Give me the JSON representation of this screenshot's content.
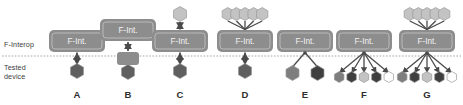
{
  "diagram": {
    "axis_labels": {
      "upper": "F-Interop",
      "lower": "Tested\ndevice"
    },
    "colors": {
      "fint_box_fill": "#8d8d8d",
      "fint_box_inner_border": "#b9b9b9",
      "fint_box_text": "#f2f2f2",
      "hex_dark": "#5f5f5f",
      "hex_darker": "#3f3f3f",
      "hex_medium": "#7e7e7e",
      "hex_light": "#c3c3c3",
      "hex_white": "#ffffff",
      "hex_outline": "#9a9a9a",
      "connector": "#4a4a4a",
      "divider": "#9a9a9a",
      "label_text": "#3b3b3b",
      "letter_text": "#2e2e2e"
    },
    "fint_label": "F-Int.",
    "columns": [
      {
        "id": "A",
        "letter": "A",
        "cx": 77,
        "fint_box": {
          "w": 56,
          "h": 22,
          "cy": 41
        },
        "top_nodes": [],
        "bottom_nodes": [
          {
            "shade": "hex_dark",
            "size": 15
          }
        ],
        "connector_type": "double-arrow",
        "intermediate_box": false
      },
      {
        "id": "B",
        "letter": "B",
        "cx": 128,
        "fint_box": {
          "w": 56,
          "h": 22,
          "cy": 30
        },
        "top_nodes": [],
        "bottom_nodes": [
          {
            "shade": "hex_dark",
            "size": 15
          }
        ],
        "connector_type": "double-arrow",
        "intermediate_box": true
      },
      {
        "id": "C",
        "letter": "C",
        "cx": 180,
        "fint_box": {
          "w": 56,
          "h": 22,
          "cy": 41
        },
        "top_nodes": [
          {
            "shade": "hex_light",
            "size": 15
          }
        ],
        "bottom_nodes": [
          {
            "shade": "hex_dark",
            "size": 15
          }
        ],
        "connector_type": "double-arrow",
        "intermediate_box": false
      },
      {
        "id": "D",
        "letter": "D",
        "cx": 245,
        "fint_box": {
          "w": 56,
          "h": 22,
          "cy": 41
        },
        "top_nodes": [
          {
            "shade": "hex_light",
            "size": 13
          },
          {
            "shade": "hex_light",
            "size": 13
          },
          {
            "shade": "hex_light",
            "size": 13
          },
          {
            "shade": "hex_light",
            "size": 13
          },
          {
            "shade": "hex_light",
            "size": 13
          }
        ],
        "bottom_nodes": [
          {
            "shade": "hex_dark",
            "size": 15
          }
        ],
        "connector_type": "double-arrow",
        "intermediate_box": false
      },
      {
        "id": "E",
        "letter": "E",
        "cx": 305,
        "fint_box": {
          "w": 56,
          "h": 22,
          "cy": 41
        },
        "top_nodes": [],
        "bottom_nodes": [
          {
            "shade": "hex_medium",
            "size": 15
          },
          {
            "shade": "hex_darker",
            "size": 15
          }
        ],
        "connector_type": "fan",
        "intermediate_box": false
      },
      {
        "id": "F",
        "letter": "F",
        "cx": 364,
        "fint_box": {
          "w": 56,
          "h": 22,
          "cy": 41
        },
        "top_nodes": [],
        "bottom_nodes": [
          {
            "shade": "hex_medium",
            "size": 11
          },
          {
            "shade": "hex_darker",
            "size": 11
          },
          {
            "shade": "hex_light",
            "size": 11
          },
          {
            "shade": "hex_darker",
            "size": 11
          },
          {
            "shade": "hex_white",
            "size": 11
          }
        ],
        "connector_type": "fan",
        "intermediate_box": false
      },
      {
        "id": "G",
        "letter": "G",
        "cx": 427,
        "fint_box": {
          "w": 56,
          "h": 22,
          "cy": 41
        },
        "top_nodes": [
          {
            "shade": "hex_light",
            "size": 13
          },
          {
            "shade": "hex_light",
            "size": 13
          },
          {
            "shade": "hex_light",
            "size": 13
          },
          {
            "shade": "hex_light",
            "size": 13
          },
          {
            "shade": "hex_light",
            "size": 13
          }
        ],
        "bottom_nodes": [
          {
            "shade": "hex_medium",
            "size": 11
          },
          {
            "shade": "hex_darker",
            "size": 11
          },
          {
            "shade": "hex_light",
            "size": 11
          },
          {
            "shade": "hex_darker",
            "size": 11
          },
          {
            "shade": "hex_white",
            "size": 11
          }
        ],
        "connector_type": "fan",
        "intermediate_box": false
      }
    ],
    "divider": {
      "y": 56,
      "style": "dotted"
    }
  }
}
